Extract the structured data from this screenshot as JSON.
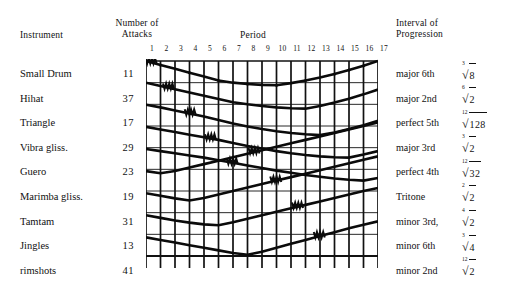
{
  "headers": {
    "instrument": "Instrument",
    "attacks_line1": "Number of",
    "attacks_line2": "Attacks",
    "period": "Period",
    "interval_line1": "Interval of",
    "interval_line2": "Progression"
  },
  "period_ticks": [
    "1",
    "2",
    "3",
    "4",
    "5",
    "6",
    "7",
    "8",
    "9",
    "10",
    "11",
    "12",
    "13",
    "14",
    "15",
    "16",
    "17"
  ],
  "rows": [
    {
      "instrument": "Small Drum",
      "attacks": "11",
      "interval": "major 6th",
      "index": "3",
      "radicand": "8"
    },
    {
      "instrument": "Hihat",
      "attacks": "37",
      "interval": "major 2nd",
      "index": "6",
      "radicand": "2"
    },
    {
      "instrument": "Triangle",
      "attacks": "17",
      "interval": "perfect 5th",
      "index": "12",
      "radicand": "128"
    },
    {
      "instrument": "Vibra gliss.",
      "attacks": "29",
      "interval": "major 3rd",
      "index": "3",
      "radicand": "2"
    },
    {
      "instrument": "Guero",
      "attacks": "23",
      "interval": "perfect 4th",
      "index": "12",
      "radicand": "32"
    },
    {
      "instrument": "Marimba gliss.",
      "attacks": "19",
      "interval": "Tritone",
      "index": "2",
      "radicand": "2"
    },
    {
      "instrument": "Tamtam",
      "attacks": "31",
      "interval": "minor 3rd,",
      "index": "4",
      "radicand": "2"
    },
    {
      "instrument": "Jingles",
      "attacks": "13",
      "interval": "minor 6th",
      "index": "3",
      "radicand": "4"
    },
    {
      "instrument": "rimshots",
      "attacks": "41",
      "interval": "minor 2nd",
      "index": "12",
      "radicand": "2"
    }
  ],
  "chart_data": {
    "type": "line",
    "title": "",
    "xlabel": "Period",
    "ylabel": "Instrument",
    "x": [
      1,
      2,
      3,
      4,
      5,
      6,
      7,
      8,
      9,
      10,
      11,
      12,
      13,
      14,
      15,
      16,
      17
    ],
    "xlim": [
      1,
      17
    ],
    "ylim": [
      0,
      9
    ],
    "grid": true,
    "legend_position": "none",
    "note": "Each instrument traces a V: it begins at its own row level at period 1, descends (on the plot, rises in row-index) to a vertex, then ascends back. Vertex period shifts right by ~1.5 periods per successive instrument. y values below are row-space positions (0 = top grid line, 9 = bottom grid line).",
    "series": [
      {
        "name": "Small Drum",
        "vertex_period": 10,
        "values": [
          0.0,
          0.18,
          0.36,
          0.54,
          0.72,
          0.9,
          1.0,
          1.06,
          1.1,
          1.12,
          1.02,
          0.9,
          0.76,
          0.6,
          0.42,
          0.22,
          0.0
        ]
      },
      {
        "name": "Hihat",
        "vertex_period": 11.5,
        "values": [
          1.0,
          1.15,
          1.3,
          1.45,
          1.6,
          1.75,
          1.9,
          2.0,
          2.08,
          2.14,
          2.18,
          2.2,
          2.08,
          1.92,
          1.74,
          1.54,
          1.32
        ]
      },
      {
        "name": "Triangle",
        "vertex_period": 13,
        "values": [
          2.02,
          2.14,
          2.28,
          2.42,
          2.56,
          2.72,
          2.88,
          3.02,
          3.14,
          3.24,
          3.32,
          3.38,
          3.42,
          3.3,
          3.14,
          2.96,
          2.76
        ]
      },
      {
        "name": "Vibra gliss.",
        "vertex_period": 14.5,
        "values": [
          3.04,
          3.16,
          3.28,
          3.4,
          3.52,
          3.64,
          3.78,
          3.92,
          4.04,
          4.16,
          4.26,
          4.34,
          4.4,
          4.44,
          4.46,
          4.32,
          4.16
        ]
      },
      {
        "name": "Guero",
        "vertex_period": 16,
        "values": [
          4.06,
          4.16,
          4.26,
          4.36,
          4.46,
          4.58,
          4.7,
          4.82,
          4.94,
          5.06,
          5.16,
          5.26,
          5.34,
          5.42,
          5.48,
          5.52,
          5.4
        ]
      },
      {
        "name": "Marimba gliss.",
        "vertex_period": 2.5,
        "values": [
          5.08,
          5.18,
          5.08,
          4.92,
          4.76,
          4.6,
          4.44,
          4.28,
          4.12,
          3.96,
          3.8,
          3.64,
          3.48,
          3.32,
          3.16,
          3.0,
          2.84
        ]
      },
      {
        "name": "Tamtam",
        "vertex_period": 4,
        "values": [
          6.1,
          6.22,
          6.34,
          6.44,
          6.32,
          6.16,
          6.0,
          5.84,
          5.68,
          5.52,
          5.36,
          5.2,
          5.04,
          4.88,
          4.72,
          4.56,
          4.4
        ]
      },
      {
        "name": "Jingles",
        "vertex_period": 5.5,
        "values": [
          7.12,
          7.24,
          7.36,
          7.46,
          7.54,
          7.58,
          7.44,
          7.28,
          7.12,
          6.96,
          6.8,
          6.64,
          6.48,
          6.32,
          6.16,
          6.0,
          5.86
        ]
      },
      {
        "name": "rimshots",
        "vertex_period": 7,
        "values": [
          8.14,
          8.26,
          8.38,
          8.5,
          8.62,
          8.74,
          8.86,
          8.94,
          8.8,
          8.62,
          8.44,
          8.26,
          8.08,
          7.9,
          7.72,
          7.56,
          7.4
        ]
      }
    ]
  }
}
